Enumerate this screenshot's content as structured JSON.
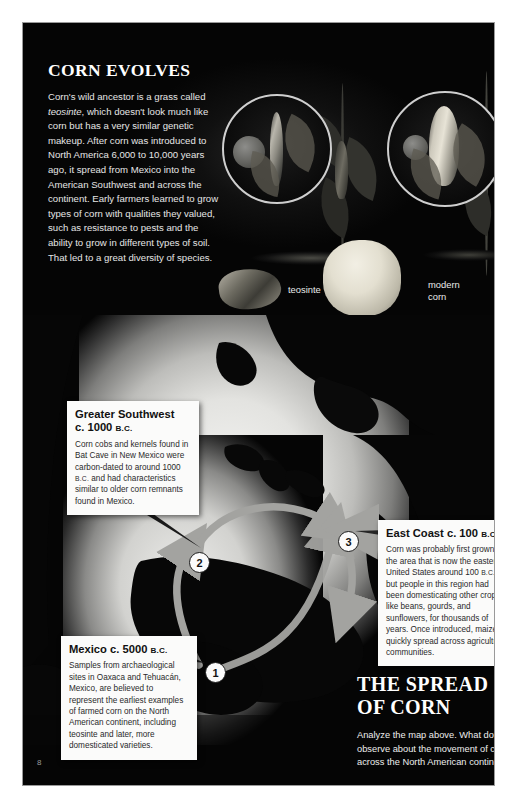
{
  "page": {
    "number": "8"
  },
  "top_section": {
    "title": "CORN EVOLVES",
    "body_part1": "Corn's wild ancestor is a grass called ",
    "body_italic": "teosinte",
    "body_part2": ", which doesn't look much like corn but has a very similar genetic makeup. After corn was introduced to North America 6,000 to 10,000 years ago, it spread from Mexico into the American Southwest and across the continent. Early farmers learned to grow types of corn with qualities they valued, such as resistance to pests and the ability to grow in different types of soil. That led to a great diversity of species.",
    "label_teosinte": "teosinte",
    "label_modern_corn": "modern\ncorn",
    "inset_left_name": "teosinte-ear-photo",
    "inset_right_name": "modern-corn-ear-photo"
  },
  "map": {
    "callouts": [
      {
        "id": "greater-southwest",
        "title": "Greater Southwest",
        "title_line2": "c. 1000 ",
        "title_era": "B.C.",
        "body_1": "Corn cobs and kernels found in Bat Cave in New Mexico were carbon-dated to around 1000 ",
        "body_era": "B.C.",
        "body_2": " and had characteristics similar to older corn remnants found in Mexico."
      },
      {
        "id": "mexico",
        "title": "Mexico c. 5000 ",
        "title_era": "B.C.",
        "body_1": "Samples from archaeological sites in Oaxaca and Tehuacán, Mexico, are believed to represent the earliest examples of farmed corn on the North American continent, including teosinte and later, more domesticated varieties."
      },
      {
        "id": "east-coast",
        "title": "East Coast c. 100 ",
        "title_era": "B.C.",
        "body_1": "Corn was probably first grown in the area that is now the eastern United States around 100 ",
        "body_era": "B.C.",
        "body_2": ", but people in this region had been domesticating other crops, like beans, gourds, and sunflowers, for thousands of years. Once introduced, maize quickly spread across agricultural communities."
      }
    ],
    "markers": [
      {
        "label": "1",
        "x": 182,
        "y": 639
      },
      {
        "label": "2",
        "x": 166,
        "y": 529
      },
      {
        "label": "3",
        "x": 315,
        "y": 508
      }
    ]
  },
  "bottom_section": {
    "title_line1": "THE SPREAD",
    "title_line2": "OF CORN",
    "question": "Analyze the map above. What do you observe about the movement of corn across the North American continent?"
  },
  "colors": {
    "page_background": "#050505",
    "callout_background": "#fbfbfa",
    "arrow_gray": "#9b9b99",
    "map_light": "#eeeeec",
    "text_light": "#f2f2f2"
  }
}
